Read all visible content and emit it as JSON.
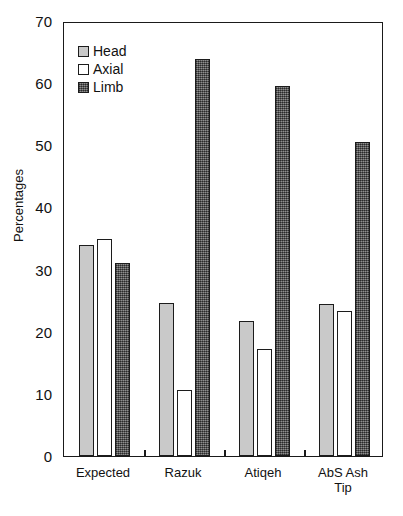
{
  "chart_data": {
    "type": "bar",
    "title": "",
    "xlabel": "",
    "ylabel": "Percentages",
    "ylim": [
      0,
      70
    ],
    "yticks": [
      0,
      10,
      20,
      30,
      40,
      50,
      60,
      70
    ],
    "ytick_labels": [
      "0",
      "10",
      "20",
      "30",
      "40",
      "50",
      "60",
      "70"
    ],
    "grid": false,
    "legend_position": "upper-left-inside",
    "categories": [
      "Expected",
      "Razuk",
      "Atiqeh",
      "AbS Ash Tip"
    ],
    "category_lines": [
      [
        "Expected"
      ],
      [
        "Razuk"
      ],
      [
        "Atiqeh"
      ],
      [
        "AbS Ash",
        "Tip"
      ]
    ],
    "series": [
      {
        "name": "Head",
        "color": "#c9c9c9",
        "pattern": "solid-light-gray",
        "values": [
          33.9,
          24.7,
          21.8,
          24.4
        ]
      },
      {
        "name": "Axial",
        "color": "#ffffff",
        "pattern": "solid-white",
        "values": [
          34.9,
          10.6,
          17.3,
          23.4
        ]
      },
      {
        "name": "Limb",
        "color": "#585858",
        "pattern": "dense-checker-dark-gray",
        "values": [
          31.0,
          63.9,
          59.6,
          50.6
        ]
      }
    ]
  },
  "axis": {
    "y_title": "Percentages"
  },
  "legend": {
    "items": [
      {
        "label": "Head",
        "swatch": "head"
      },
      {
        "label": "Axial",
        "swatch": "axial"
      },
      {
        "label": "Limb",
        "swatch": "limb"
      }
    ]
  }
}
